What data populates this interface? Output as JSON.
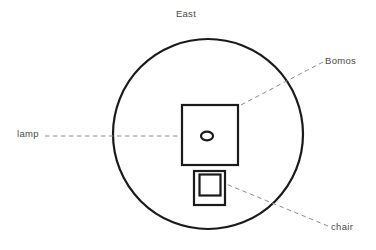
{
  "diagram": {
    "title": "East",
    "labels": {
      "north": "East",
      "bomos": "Bomos",
      "lamp": "lamp",
      "chair": "chair"
    },
    "colors": {
      "stroke": "#1a1a1a",
      "text": "#4a4a4a",
      "leader": "#8c8c8c",
      "background": "#ffffff"
    },
    "shapes": {
      "circle": {
        "cx": 208,
        "cy": 134,
        "r": 95,
        "stroke_width": 2.2
      },
      "bomos_square": {
        "x": 182,
        "y": 105,
        "width": 56,
        "height": 60,
        "stroke_width": 2.2
      },
      "lamp_oval": {
        "cx": 207,
        "cy": 136,
        "rx": 6,
        "ry": 4.3,
        "stroke_width": 2.2
      },
      "chair_outer": {
        "x": 194,
        "y": 171,
        "width": 31,
        "height": 34,
        "stroke_width": 2.2
      },
      "chair_inner": {
        "x": 199,
        "y": 174,
        "width": 22,
        "height": 22,
        "stroke_width": 2.2
      }
    },
    "leaders": {
      "bomos": {
        "x1": 323,
        "y1": 62,
        "x2": 239,
        "y2": 106
      },
      "lamp": {
        "x1": 45,
        "y1": 136,
        "x2": 199,
        "y2": 136
      },
      "chair": {
        "x1": 328,
        "y1": 226,
        "x2": 226,
        "y2": 184
      }
    }
  }
}
